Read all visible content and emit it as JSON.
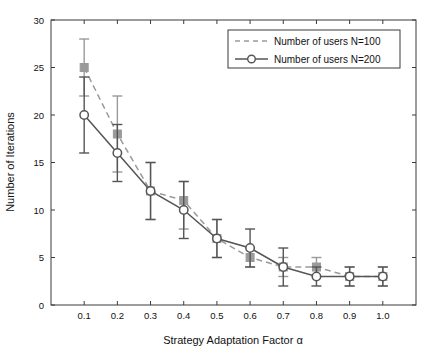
{
  "chart_data": {
    "type": "line",
    "title": "",
    "xlabel": "Strategy Adaptation Factor α",
    "ylabel": "Number of Iterations",
    "xlim": [
      0.0,
      1.1
    ],
    "ylim": [
      0,
      30
    ],
    "xticks": [
      0.1,
      0.2,
      0.3,
      0.4,
      0.5,
      0.6,
      0.7,
      0.8,
      0.9,
      1.0
    ],
    "xtick_labels": [
      "0.1",
      "0.2",
      "0.3",
      "0.4",
      "0.5",
      "0.6",
      "0.7",
      "0.8",
      "0.9",
      "1.0"
    ],
    "yticks": [
      0,
      5,
      10,
      15,
      20,
      25,
      30
    ],
    "ytick_labels": [
      "0",
      "5",
      "10",
      "15",
      "20",
      "25",
      "30"
    ],
    "grid": false,
    "legend_position": "top-right",
    "x": [
      0.1,
      0.2,
      0.3,
      0.4,
      0.5,
      0.6,
      0.7,
      0.8,
      0.9,
      1.0
    ],
    "series": [
      {
        "name": "Number of users N=100",
        "label": "Number of users N=100",
        "color": "#9a9a9a",
        "linestyle": "dashed",
        "marker": "square",
        "values": [
          25,
          18,
          12,
          11,
          7,
          5,
          4,
          4,
          3,
          3
        ],
        "err_low": [
          22,
          14,
          9,
          8,
          5,
          4,
          3,
          3,
          2,
          2
        ],
        "err_high": [
          28,
          22,
          15,
          13,
          9,
          6,
          5,
          5,
          4,
          4
        ]
      },
      {
        "name": "Number of users N=200",
        "label": "Number of users N=200",
        "color": "#555555",
        "linestyle": "solid",
        "marker": "circle",
        "values": [
          20,
          16,
          12,
          10,
          7,
          6,
          4,
          3,
          3,
          3
        ],
        "err_low": [
          16,
          13,
          9,
          7,
          5,
          4,
          2,
          2,
          2,
          2
        ],
        "err_high": [
          24,
          19,
          15,
          13,
          9,
          8,
          6,
          4,
          4,
          4
        ]
      }
    ]
  }
}
